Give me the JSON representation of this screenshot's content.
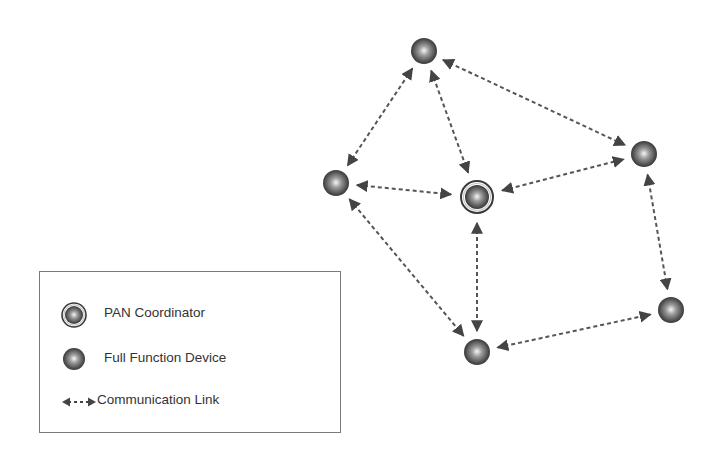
{
  "diagram": {
    "title": "",
    "colors": {
      "node_dark": "#3a3a3a",
      "node_light": "#f4f4f4",
      "link": "#555555",
      "legend_border": "#7a7a7a",
      "text": "#333333"
    },
    "nodes": [
      {
        "id": "top",
        "type": "ffd",
        "x": 424,
        "y": 51
      },
      {
        "id": "left",
        "type": "ffd",
        "x": 336,
        "y": 183
      },
      {
        "id": "coordinator",
        "type": "pan",
        "x": 477,
        "y": 197
      },
      {
        "id": "right",
        "type": "ffd",
        "x": 644,
        "y": 154
      },
      {
        "id": "far-right",
        "type": "ffd",
        "x": 671,
        "y": 310
      },
      {
        "id": "bottom",
        "type": "ffd",
        "x": 477,
        "y": 352
      }
    ],
    "links": [
      {
        "from": "top",
        "to": "left"
      },
      {
        "from": "top",
        "to": "coordinator"
      },
      {
        "from": "top",
        "to": "right"
      },
      {
        "from": "left",
        "to": "coordinator"
      },
      {
        "from": "left",
        "to": "bottom"
      },
      {
        "from": "coordinator",
        "to": "right"
      },
      {
        "from": "coordinator",
        "to": "bottom"
      },
      {
        "from": "right",
        "to": "far-right"
      },
      {
        "from": "bottom",
        "to": "far-right"
      }
    ]
  },
  "legend": {
    "items": [
      {
        "icon": "pan-coordinator-icon",
        "label": "PAN Coordinator"
      },
      {
        "icon": "full-function-device-icon",
        "label": "Full Function Device"
      },
      {
        "icon": "communication-link-icon",
        "label": "Communication Link"
      }
    ]
  }
}
